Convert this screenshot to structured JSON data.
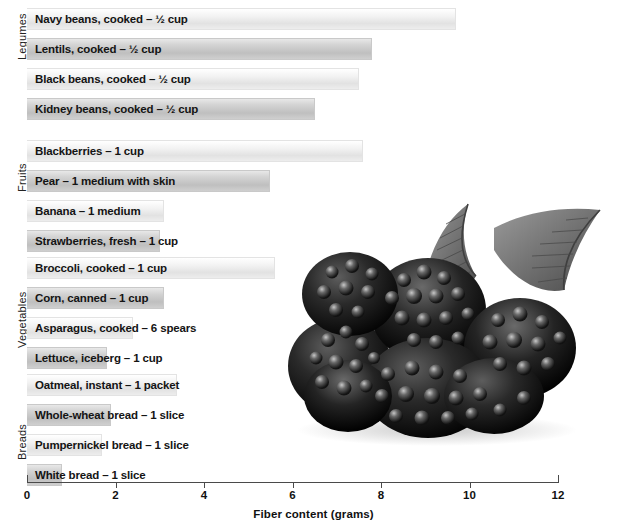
{
  "chart_data": {
    "type": "bar",
    "orientation": "horizontal",
    "title": "",
    "xlabel": "Fiber content (grams)",
    "ylabel": "",
    "xlim": [
      0,
      12
    ],
    "xticks": [
      0,
      2,
      4,
      6,
      8,
      10,
      12
    ],
    "xtick_labels": [
      "0",
      "2",
      "4",
      "6",
      "8",
      "10",
      "12"
    ],
    "grid": false,
    "legend": "none",
    "groups": [
      {
        "name": "Legumes",
        "items": [
          {
            "label": "Navy beans, cooked – ½ cup",
            "value": 9.7,
            "shade": "light"
          },
          {
            "label": "Lentils, cooked – ½ cup",
            "value": 7.8,
            "shade": "dark"
          },
          {
            "label": "Black beans, cooked – ½ cup",
            "value": 7.5,
            "shade": "light"
          },
          {
            "label": "Kidney beans, cooked – ½ cup",
            "value": 6.5,
            "shade": "dark"
          }
        ]
      },
      {
        "name": "Fruits",
        "items": [
          {
            "label": "Blackberries – 1 cup",
            "value": 7.6,
            "shade": "light"
          },
          {
            "label": "Pear – 1 medium with skin",
            "value": 5.5,
            "shade": "dark"
          },
          {
            "label": "Banana – 1 medium",
            "value": 3.1,
            "shade": "light"
          },
          {
            "label": "Strawberries, fresh – 1 cup",
            "value": 3.0,
            "shade": "dark"
          }
        ]
      },
      {
        "name": "Vegetables",
        "items": [
          {
            "label": "Broccoli, cooked – 1 cup",
            "value": 5.6,
            "shade": "light"
          },
          {
            "label": "Corn, canned – 1 cup",
            "value": 3.1,
            "shade": "dark"
          },
          {
            "label": "Asparagus, cooked – 6 spears",
            "value": 2.4,
            "shade": "light"
          },
          {
            "label": "Lettuce, iceberg – 1 cup",
            "value": 1.8,
            "shade": "dark"
          }
        ]
      },
      {
        "name": "Breads",
        "items": [
          {
            "label": "Oatmeal, instant – 1 packet",
            "value": 3.4,
            "shade": "light"
          },
          {
            "label": "Whole-wheat bread – 1 slice",
            "value": 1.9,
            "shade": "dark"
          },
          {
            "label": "Pumpernickel bread – 1 slice",
            "value": 1.7,
            "shade": "light"
          },
          {
            "label": "White bread – 1 slice",
            "value": 0.8,
            "shade": "dark"
          }
        ]
      }
    ]
  },
  "photo": {
    "name": "blackberries-photo",
    "alt": "Cluster of blackberries with leaves"
  },
  "colors": {
    "bar_light": "#ededed",
    "bar_dark": "#c9c9c9",
    "axis": "#4a4a4a",
    "text": "#111111"
  }
}
